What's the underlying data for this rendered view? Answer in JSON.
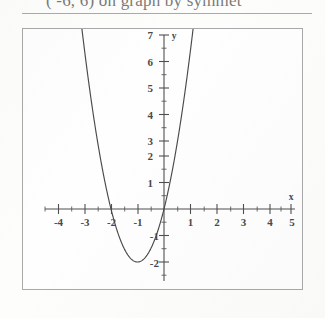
{
  "header": {
    "text": "( -6, 6) on graph by symmet"
  },
  "graph": {
    "y_axis_name": "y",
    "x_axis_name": "x",
    "x_tick_labels": [
      "-4",
      "-3",
      "-2",
      "-1",
      "1",
      "2",
      "3",
      "4",
      "5"
    ],
    "y_tick_labels": [
      "7",
      "6",
      "5",
      "4",
      "3",
      "2",
      "1",
      "-1",
      "-2"
    ]
  },
  "chart_data": {
    "type": "line",
    "title": "",
    "xlabel": "x",
    "ylabel": "y",
    "xlim": [
      -4.6,
      5.3
    ],
    "ylim": [
      -3.1,
      7.4
    ],
    "grid": false,
    "legend": "none",
    "x_ticks": [
      -4,
      -3,
      -2,
      -1,
      1,
      2,
      3,
      4,
      5
    ],
    "y_ticks": [
      7,
      6,
      5,
      4,
      3,
      2,
      1,
      -1,
      -2
    ],
    "x_minor_tick_step": 0.5,
    "y_minor_tick_step": 0.5,
    "series": [
      {
        "name": "y = 2(x+1)^2 - 2",
        "vertex": [
          -1,
          -2
        ],
        "roots": [
          -2,
          0
        ],
        "a": 2,
        "x": [
          -2.95,
          -2.75,
          -2.5,
          -2.25,
          -2.0,
          -1.75,
          -1.5,
          -1.25,
          -1.0,
          -0.75,
          -0.5,
          -0.25,
          0.0,
          0.25,
          0.5,
          0.75,
          1.0
        ],
        "y": [
          5.61,
          4.13,
          2.5,
          1.13,
          0.0,
          -0.88,
          -1.5,
          -1.88,
          -2.0,
          -1.88,
          -1.5,
          -0.88,
          0.0,
          1.13,
          2.5,
          4.13,
          6.0
        ]
      }
    ]
  }
}
